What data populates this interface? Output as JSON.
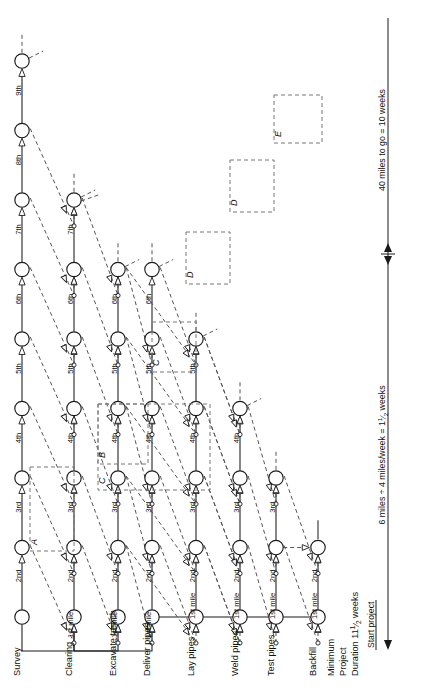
{
  "diagram": {
    "orientation": "rotated-90-ccw",
    "node_shape": "circle",
    "colors": {
      "line": "#1a1a1a",
      "dashed": "#555555",
      "box": "#777777",
      "node_fill": "#ffffff",
      "text": "#111111"
    }
  },
  "rows": [
    {
      "id": "survey",
      "label": "Survey",
      "milestones": [
        "1st mile",
        "2nd",
        "3rd",
        "4th",
        "5th",
        "6th",
        "7th",
        "8th",
        "9th"
      ]
    },
    {
      "id": "clearing",
      "label": "Clearing",
      "milestones": [
        "1st mile",
        "2nd",
        "3rd",
        "4th",
        "5th",
        "6th",
        "7th"
      ]
    },
    {
      "id": "excavate-trench",
      "label": "Excavate trench",
      "milestones": [
        "1st mile",
        "2nd",
        "3rd",
        "4th",
        "5th",
        "6th"
      ]
    },
    {
      "id": "deliver-pipes",
      "label": "Deliver pipes",
      "milestones": [
        "1st mile",
        "2nd",
        "3rd",
        "4th",
        "5th",
        "6th"
      ]
    },
    {
      "id": "lay-pipes",
      "label": "Lay pipes",
      "milestones": [
        "1st mile",
        "2nd",
        "3rd",
        "4th",
        "5th"
      ]
    },
    {
      "id": "weld-pipes",
      "label": "Weld pipes",
      "milestones": [
        "1st mile",
        "2nd",
        "3rd",
        "4th"
      ]
    },
    {
      "id": "test-pipes",
      "label": "Test pipes",
      "milestones": [
        "1st mile",
        "2nd",
        "3rd"
      ]
    },
    {
      "id": "backfill",
      "label": "Backfill",
      "milestones": [
        "1st mile",
        "2nd"
      ]
    }
  ],
  "summary": {
    "line1": "Minimum",
    "line2": "Project",
    "line3_prefix": "Duration 11",
    "line3_fraction_num": "1",
    "line3_fraction_den": "2",
    "line3_suffix": " weeks"
  },
  "annotations": {
    "start_project": "Start project",
    "scale_top": "40 miles to go = 10 weeks",
    "scale_bottom_prefix": "6 miles ÷ 4 miles/week = 1",
    "scale_bottom_num": "1",
    "scale_bottom_den": "2",
    "scale_bottom_suffix": " weeks"
  },
  "groups": [
    {
      "id": "A",
      "label": "A"
    },
    {
      "id": "B",
      "label": "B"
    },
    {
      "id": "C",
      "label": "C"
    },
    {
      "id": "C2",
      "label": "C"
    },
    {
      "id": "D",
      "label": "D"
    },
    {
      "id": "D2",
      "label": "D"
    },
    {
      "id": "E",
      "label": "E"
    }
  ]
}
